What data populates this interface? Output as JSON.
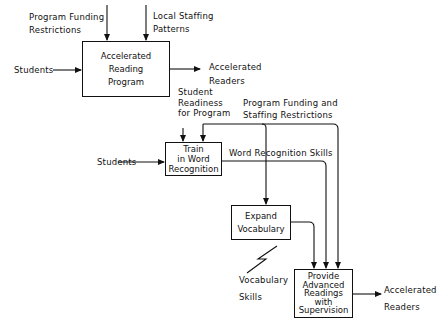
{
  "top_diagram": {
    "box": {
      "label": "Accelerated\nReading\nProgram"
    },
    "inputs": {
      "funding": "Program Funding\nRestrictions",
      "staffing": "Local Staffing\nPatterns",
      "students": "Students"
    },
    "output": "Accelerated\nReaders"
  },
  "bottom_diagram": {
    "inputs": {
      "readiness": "Student\nReadiness\nfor Program",
      "funding_staffing": "Program Funding and\nStaffing Restrictions",
      "students": "Students"
    },
    "boxes": [
      {
        "id": "train",
        "label": "Train\nin Word\nRecognition"
      },
      {
        "id": "expand",
        "label": "Expand\nVocabulary"
      },
      {
        "id": "provide",
        "label": "Provide\nAdvanced\nReadings\nwith\nSupervision"
      }
    ],
    "flows": {
      "word_recognition": "Word Recognition Skills",
      "vocabulary": "Vocabulary\n\nSkills"
    },
    "output": "Accelerated\nReaders"
  },
  "colors": {
    "ink": "#111111",
    "background": "#ffffff"
  }
}
